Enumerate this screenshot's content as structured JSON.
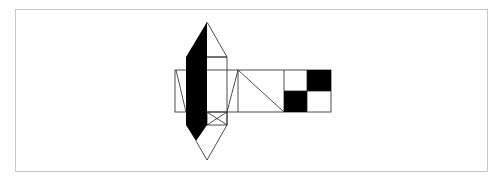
{
  "diagram": {
    "colors": {
      "background": "#ffffff",
      "frame": "#c8c8c8",
      "stroke": "#222222",
      "fill_dark": "#000000"
    },
    "frame": {
      "x": 15,
      "y": 9,
      "width": 473,
      "height": 163
    },
    "strip": {
      "x": 175,
      "y": 70,
      "width": 156,
      "height": 42
    },
    "checker": {
      "x": 284,
      "y": 70,
      "width": 47,
      "height": 42
    },
    "top_apex": [
      207,
      22
    ],
    "bottom_apex": [
      207,
      160
    ]
  }
}
